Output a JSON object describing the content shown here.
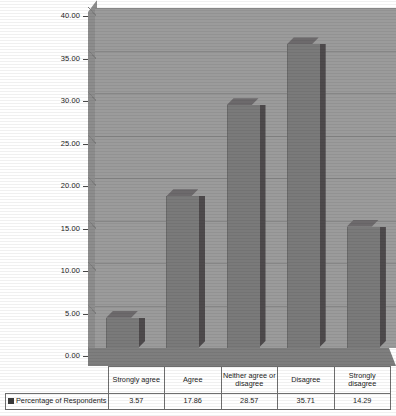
{
  "chart_data": {
    "type": "bar",
    "title": "",
    "xlabel": "",
    "ylabel": "",
    "categories": [
      "Strongly agree",
      "Agree",
      "Neither agree or disagree",
      "Disagree",
      "Strongly disagree"
    ],
    "series": [
      {
        "name": "Percentage of Respondents",
        "values": [
          3.57,
          17.86,
          28.57,
          35.71,
          14.29
        ]
      }
    ],
    "value_labels": [
      "3.57",
      "17.86",
      "28.57",
      "35.71",
      "14.29"
    ],
    "ylim": [
      0,
      40
    ],
    "ytick_step": 5,
    "ytick_labels": [
      "0.00",
      "5.00",
      "10.00",
      "15.00",
      "20.00",
      "25.00",
      "30.00",
      "35.00",
      "40.00"
    ],
    "grid": true,
    "legend_position": "bottom-table",
    "style": "3d-column",
    "colors": {
      "bar_front": "#7a7a7a",
      "bar_side": "#4e4a4c",
      "bar_top": "#6d6a6c",
      "plot_background": "#9b9b9b",
      "floor": "#7e7e7e",
      "gridline": "#7f7f7f",
      "legend_swatch": "#3a3a3a"
    }
  },
  "table": {
    "legend_label": "Percentage of Respondents",
    "legend_icon": "square-swatch-icon"
  }
}
